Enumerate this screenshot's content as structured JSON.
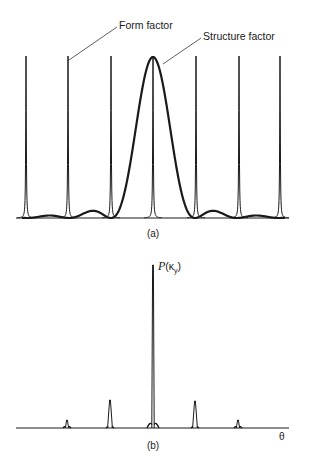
{
  "figure": {
    "top_cutoff_text": "",
    "panel_a": {
      "caption": "(a)",
      "annotations": {
        "form_factor": "Form factor",
        "structure_factor": "Structure factor"
      },
      "baseline_y": 218,
      "x_range": [
        16,
        289
      ],
      "form_factor_spikes_x": [
        26,
        68,
        111,
        153,
        196,
        239,
        280
      ],
      "spike_top_y": 56,
      "structure_factor": {
        "main_peak_x": 153,
        "main_peak_top_y": 57,
        "side_lobes_x": [
          65,
          240
        ],
        "side_lobe_top_y": 210
      }
    },
    "panel_b": {
      "caption": "(b)",
      "y_label": {
        "symbol": "P",
        "open": "(",
        "var": "κ",
        "sub": "y",
        "close": ")"
      },
      "x_label": "θ",
      "baseline_y": 428,
      "x_range": [
        16,
        289
      ],
      "peaks": [
        {
          "x": 67,
          "top_y": 420
        },
        {
          "x": 110,
          "top_y": 400
        },
        {
          "x": 153,
          "top_y": 265
        },
        {
          "x": 195,
          "top_y": 401
        },
        {
          "x": 238,
          "top_y": 420
        }
      ]
    }
  },
  "colors": {
    "ink": "#1a1a1a",
    "background": "#ffffff"
  }
}
